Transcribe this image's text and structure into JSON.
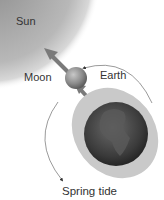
{
  "diagram": {
    "title": "Spring tide",
    "labels": {
      "sun": "Sun",
      "moon": "Moon",
      "earth": "Earth"
    },
    "colors": {
      "sun": "#b9b9b9",
      "moon": "#8c8c8c",
      "earth": "#3c3c3c",
      "tidal_bulge": "#c8c8c8",
      "arrow": "#7a7a7a",
      "orbit": "#555555"
    }
  }
}
